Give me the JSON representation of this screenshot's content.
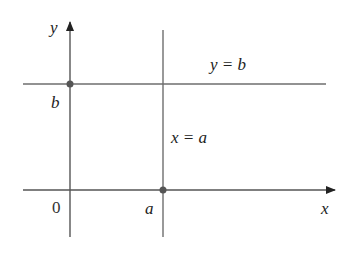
{
  "diagram": {
    "axes": {
      "x_label": "x",
      "y_label": "y",
      "origin_label": "0"
    },
    "lines": [
      {
        "equation": "y = b",
        "type": "horizontal"
      },
      {
        "equation": "x = a",
        "type": "vertical"
      }
    ],
    "points": [
      {
        "label": "b",
        "location": "y-axis intercept (0, b)"
      },
      {
        "label": "a",
        "location": "x-axis intercept (a, 0)"
      }
    ],
    "colors": {
      "lines": "#6e6e6e",
      "axes": "#555555",
      "points": "#555555",
      "text": "#222222"
    }
  }
}
